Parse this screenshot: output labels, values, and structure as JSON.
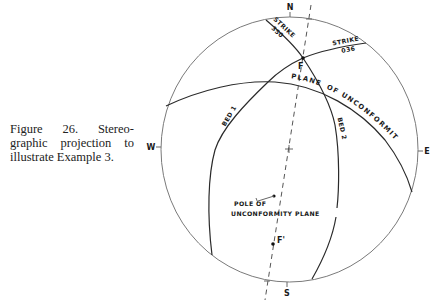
{
  "caption": {
    "lines": [
      "Figure 26. Stereo-",
      "graphic projection to",
      "illustrate Example 3."
    ]
  },
  "compass": {
    "north": "N",
    "south": "S",
    "east": "E",
    "west": "W"
  },
  "labels": {
    "strike_350": {
      "word": "STRIKE",
      "value": "350"
    },
    "strike_036": {
      "word": "STRIKE",
      "value": "036"
    },
    "point_f": "F",
    "point_f_prime": "F'",
    "plane_part1": "PLANE",
    "plane_part2": "OF UNCONFORMITY",
    "bed_1": "BED 1",
    "bed_2": "BED 2",
    "pole_line1": "POLE OF",
    "pole_line2": "UNCONFORMITY PLANE"
  },
  "colors": {
    "background": "#ffffff",
    "great_circles": "#2a2a2a",
    "primitive_circle": "#7a7a7a",
    "text": "#1a1a1a"
  }
}
